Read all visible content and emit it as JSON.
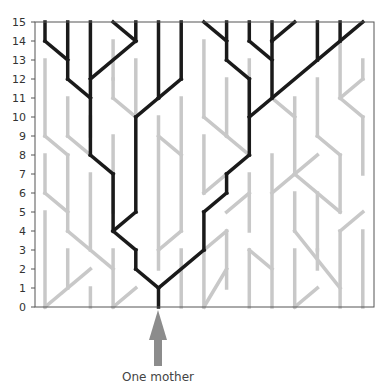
{
  "chart_data": {
    "type": "diagram",
    "title": "",
    "yaxis": {
      "label": "",
      "ticks": [
        0,
        1,
        2,
        3,
        4,
        5,
        6,
        7,
        8,
        9,
        10,
        11,
        12,
        13,
        14,
        15
      ],
      "range": [
        0,
        15
      ]
    },
    "xaxis": {
      "label": "",
      "columns": 15
    },
    "annotation": {
      "text": "One mother",
      "points_to": {
        "column": 5,
        "generation": 0
      }
    },
    "colors": {
      "lineage": "#1a1a1a",
      "other": "#c8c8c8",
      "arrow": "#8c8c8c",
      "frame": "#555555"
    },
    "black_segments": [
      [
        0,
        15,
        0,
        14
      ],
      [
        0,
        14,
        1,
        13
      ],
      [
        1,
        15,
        1,
        12
      ],
      [
        1,
        12,
        2,
        11
      ],
      [
        2,
        15,
        2,
        8
      ],
      [
        3,
        15,
        4,
        14
      ],
      [
        4,
        15,
        4,
        14
      ],
      [
        4,
        14,
        2,
        12
      ],
      [
        2,
        8,
        3,
        7
      ],
      [
        3,
        7,
        3,
        4
      ],
      [
        5,
        15,
        5,
        11
      ],
      [
        6,
        15,
        6,
        12
      ],
      [
        6,
        12,
        5,
        11
      ],
      [
        5,
        11,
        4,
        10
      ],
      [
        4,
        10,
        4,
        5
      ],
      [
        4,
        5,
        3,
        4
      ],
      [
        3,
        4,
        4,
        3
      ],
      [
        4,
        3,
        4,
        2
      ],
      [
        4,
        2,
        5,
        1
      ],
      [
        5,
        1,
        5,
        0
      ],
      [
        7,
        15,
        8,
        14
      ],
      [
        8,
        15,
        8,
        13
      ],
      [
        8,
        13,
        9,
        12
      ],
      [
        9,
        15,
        9,
        14
      ],
      [
        9,
        14,
        10,
        13
      ],
      [
        10,
        15,
        10,
        14
      ],
      [
        10,
        14,
        11,
        15
      ],
      [
        10,
        14,
        10,
        11
      ],
      [
        9,
        12,
        9,
        8
      ],
      [
        9,
        10,
        14,
        15
      ],
      [
        12,
        15,
        12,
        13
      ],
      [
        13,
        15,
        13,
        14
      ],
      [
        9,
        8,
        8,
        7
      ],
      [
        8,
        7,
        8,
        6
      ],
      [
        8,
        6,
        7,
        5
      ],
      [
        7,
        5,
        7,
        3
      ],
      [
        7,
        3,
        5,
        1
      ]
    ],
    "gray_segments": [
      [
        0,
        13,
        0,
        9
      ],
      [
        0,
        9,
        1,
        8
      ],
      [
        1,
        11,
        1,
        9
      ],
      [
        1,
        9,
        2,
        8
      ],
      [
        1,
        8,
        1,
        4
      ],
      [
        0,
        8,
        0,
        6
      ],
      [
        0,
        6,
        1,
        5
      ],
      [
        1,
        4,
        3,
        2
      ],
      [
        2,
        7,
        2,
        3
      ],
      [
        3,
        3,
        3,
        0
      ],
      [
        0,
        5,
        0,
        0
      ],
      [
        0,
        0,
        2,
        2
      ],
      [
        1,
        3,
        1,
        1
      ],
      [
        2,
        1,
        2,
        0
      ],
      [
        3,
        0,
        4,
        1
      ],
      [
        3,
        14,
        3,
        12
      ],
      [
        3,
        11,
        3,
        12
      ],
      [
        3,
        11,
        4,
        10
      ],
      [
        4,
        13,
        4,
        10
      ],
      [
        3,
        9,
        3,
        5
      ],
      [
        2,
        10,
        2,
        9
      ],
      [
        5,
        10,
        5,
        2
      ],
      [
        5,
        3,
        6,
        4
      ],
      [
        6,
        11,
        6,
        4
      ],
      [
        6,
        3,
        6,
        0
      ],
      [
        5,
        9,
        6,
        8
      ],
      [
        7,
        14,
        7,
        10
      ],
      [
        7,
        10,
        8,
        9
      ],
      [
        8,
        12,
        8,
        9
      ],
      [
        7,
        9,
        7,
        6
      ],
      [
        7,
        6,
        8,
        7
      ],
      [
        7,
        3,
        7,
        0
      ],
      [
        7,
        0,
        8,
        2
      ],
      [
        7,
        3,
        8,
        4
      ],
      [
        8,
        4,
        8,
        1
      ],
      [
        9,
        13,
        9,
        10
      ],
      [
        8,
        9,
        9,
        8
      ],
      [
        9,
        7,
        9,
        4
      ],
      [
        9,
        3,
        9,
        0
      ],
      [
        9,
        3,
        10,
        2
      ],
      [
        8,
        5,
        9,
        6
      ],
      [
        10,
        11,
        11,
        10
      ],
      [
        11,
        11,
        11,
        7
      ],
      [
        11,
        7,
        12,
        8
      ],
      [
        11,
        7,
        13,
        5
      ],
      [
        12,
        12,
        12,
        9
      ],
      [
        12,
        9,
        13,
        8
      ],
      [
        13,
        14,
        13,
        11
      ],
      [
        13,
        11,
        14,
        12
      ],
      [
        13,
        11,
        14,
        10
      ],
      [
        14,
        10,
        14,
        7
      ],
      [
        13,
        8,
        13,
        5
      ],
      [
        14,
        13,
        14,
        12
      ],
      [
        10,
        8,
        10,
        0
      ],
      [
        10,
        6,
        11,
        7
      ],
      [
        11,
        6,
        11,
        4
      ],
      [
        11,
        4,
        13,
        1
      ],
      [
        12,
        6,
        12,
        3
      ],
      [
        13,
        4,
        13,
        0
      ],
      [
        13,
        4,
        14,
        5
      ],
      [
        14,
        4,
        14,
        0
      ],
      [
        11,
        3,
        11,
        0
      ],
      [
        11,
        0,
        12,
        1
      ],
      [
        12,
        3,
        12,
        2
      ]
    ]
  },
  "labels": {
    "caption": "One mother"
  }
}
